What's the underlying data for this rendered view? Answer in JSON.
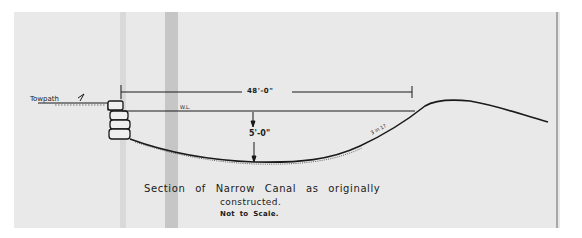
{
  "diagram": {
    "type": "engineering cross-section drawing",
    "labels": {
      "towpath": "Towpath",
      "width_dimension": "48'-0\"",
      "water_level": "W.L.",
      "depth_dimension": "5'-0\"",
      "slope": "3 in 1?"
    },
    "caption": {
      "line1": "Section of Narrow Canal as originally",
      "line2": "constructed.",
      "line3": "Not to Scale."
    },
    "colors": {
      "paper": "#e9e9e9",
      "ink": "#1a1a1a",
      "background": "#ffffff"
    }
  }
}
